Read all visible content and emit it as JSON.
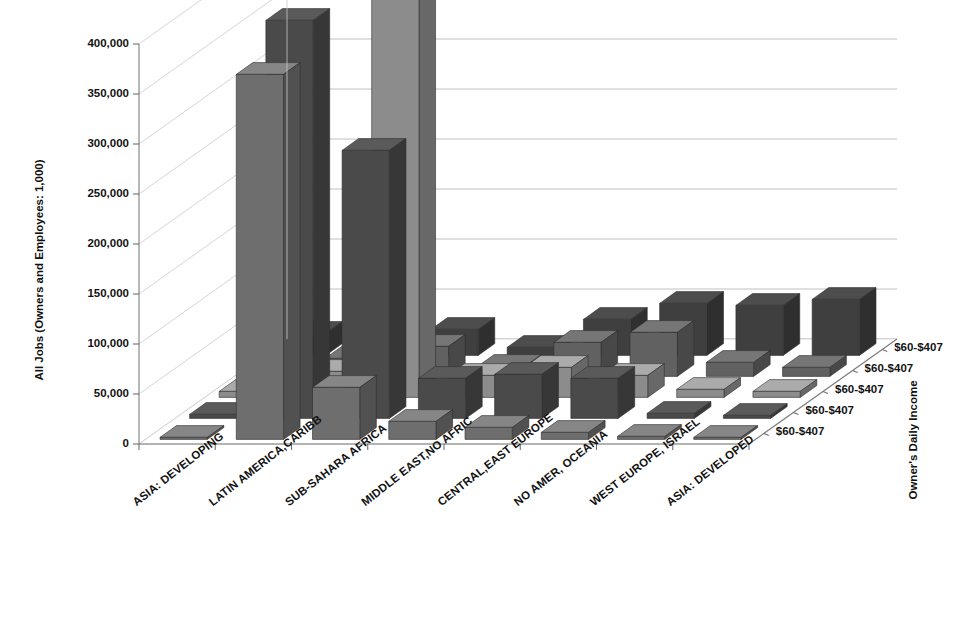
{
  "chart_data": {
    "type": "bar",
    "title": "",
    "subtitle": "",
    "ylabel": "All Jobs (Owners and Employees: 1,000)",
    "xlabel": "",
    "zlabel": "Owner's Daily Income",
    "ylim": [
      0,
      400000
    ],
    "ytick_labels": [
      "0",
      "50,000",
      "100,000",
      "150,000",
      "200,000",
      "250,000",
      "300,000",
      "350,000",
      "400,000"
    ],
    "ytick_values": [
      0,
      50000,
      100000,
      150000,
      200000,
      250000,
      300000,
      350000,
      400000
    ],
    "grid": true,
    "legend_position": "none",
    "projection": "3d",
    "categories": [
      "ASIA: DEVELOPING",
      "LATIN AMERICA,CARIBB",
      "SUB-SAHARA AFRICA",
      "MIDDLE EAST,NO AFRIC",
      "CENTRAL,EAST EUROPE",
      "NO AMER, OCEANIA",
      "WEST EUROPE, ISRAEL",
      "ASIA: DEVELOPED"
    ],
    "depth_labels": [
      "$60-$407",
      "$60-$407",
      "$60-$407",
      "$60-$407",
      "$60-$407"
    ],
    "series": [
      {
        "name": "$60-$407",
        "row": 1,
        "color": "#6e6e6e",
        "values": [
          2000,
          365000,
          52000,
          18000,
          12000,
          7000,
          3000,
          2000
        ]
      },
      {
        "name": "$60-$407",
        "row": 2,
        "color": "#4a4a4a",
        "values": [
          4000,
          398000,
          268000,
          40000,
          44000,
          40000,
          5000,
          3000
        ]
      },
      {
        "name": "$60-$407",
        "row": 3,
        "color": "#8c8c8c",
        "values": [
          6000,
          26000,
          408000,
          22000,
          30000,
          22000,
          8000,
          6000
        ]
      },
      {
        "name": "$60-$407",
        "row": 4,
        "color": "#616161",
        "values": [
          10000,
          18000,
          30000,
          10000,
          34000,
          44000,
          14000,
          9000
        ]
      },
      {
        "name": "$60-$407",
        "row": 5,
        "color": "#3f3f3f",
        "values": [
          22000,
          24000,
          26000,
          8000,
          36000,
          52000,
          50000,
          56000
        ]
      }
    ]
  },
  "colors": {
    "background": "#ffffff",
    "gridline": "#b9b9b9",
    "axis": "#7d7d7d",
    "text": "#131313"
  }
}
